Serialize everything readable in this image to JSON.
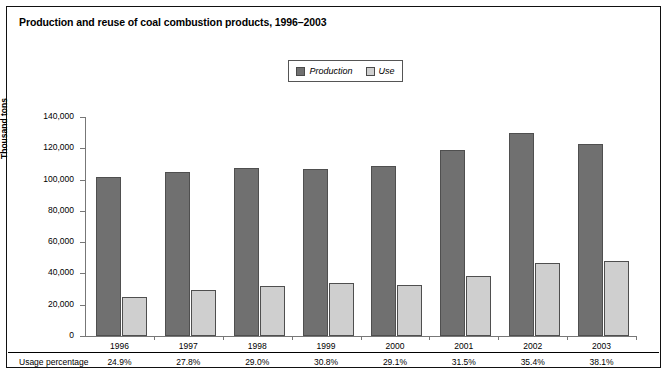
{
  "chart_data": {
    "type": "bar",
    "title": "Production and reuse of coal combustion products, 1996–2003",
    "xlabel": "",
    "ylabel": "Thousand tons",
    "ylim": [
      0,
      140000
    ],
    "yticks": [
      0,
      20000,
      40000,
      60000,
      80000,
      100000,
      120000,
      140000
    ],
    "ytick_labels": [
      "0",
      "20,000",
      "40,000",
      "60,000",
      "80,000",
      "100,000",
      "120,000",
      "140,000"
    ],
    "categories": [
      "1996",
      "1997",
      "1998",
      "1999",
      "2000",
      "2001",
      "2002",
      "2003"
    ],
    "series": [
      {
        "name": "Production",
        "color": "#707070",
        "values": [
          101400,
          105000,
          107500,
          107000,
          108700,
          118800,
          130100,
          122500
        ]
      },
      {
        "name": "Use",
        "color": "#cfcfcf",
        "values": [
          25200,
          29200,
          31900,
          33900,
          32400,
          38300,
          46600,
          47800
        ]
      }
    ],
    "annotation_row": {
      "label": "Usage percentage",
      "values": [
        "24.9%",
        "27.8%",
        "29.0%",
        "30.8%",
        "29.1%",
        "31.5%",
        "35.4%",
        "38.1%"
      ]
    },
    "grid": false,
    "legend_position": "top-center"
  },
  "legend": {
    "entries": [
      {
        "label": "Production",
        "color": "#707070"
      },
      {
        "label": "Use",
        "color": "#cfcfcf"
      }
    ]
  }
}
